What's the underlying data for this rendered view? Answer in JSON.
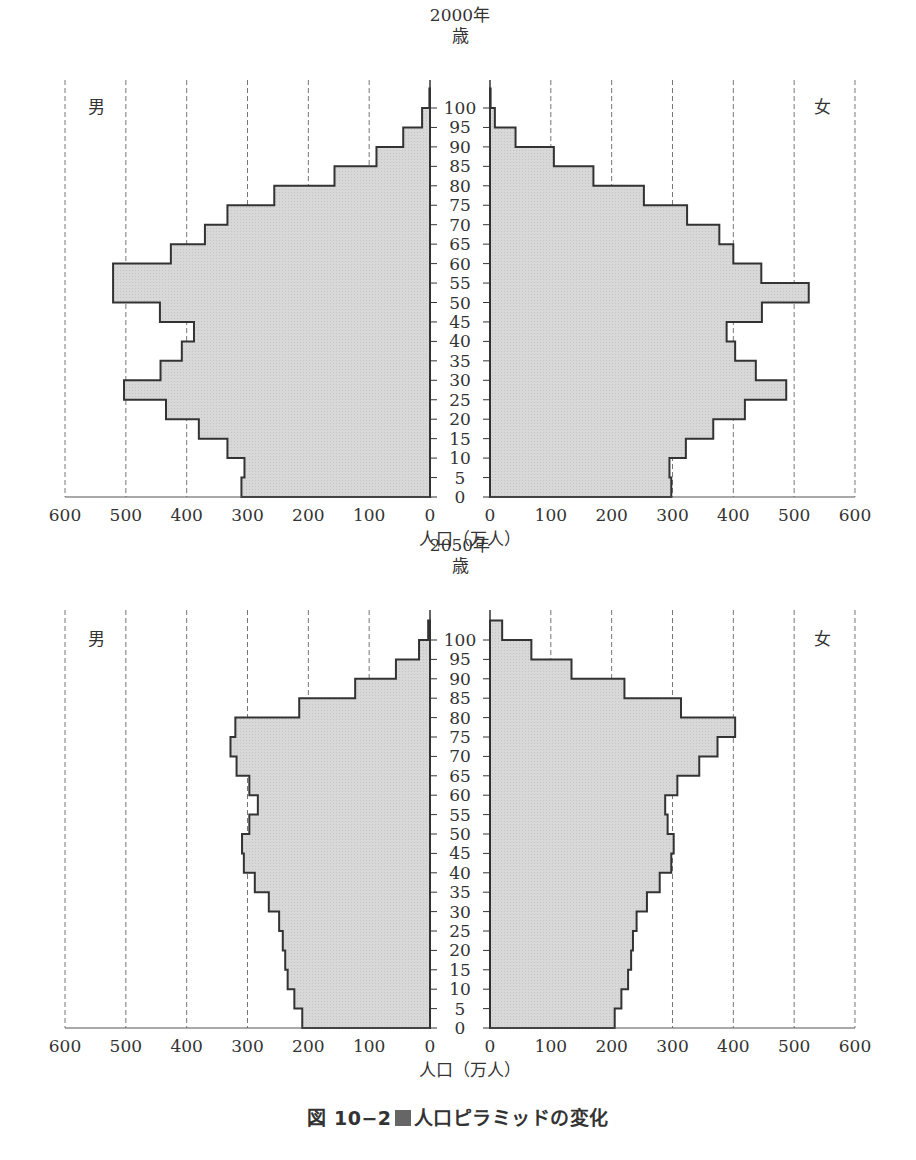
{
  "figure": {
    "caption_prefix": "図 10−2",
    "caption_text": "人口ピラミッドの変化",
    "age_unit_label": "歳",
    "male_label": "男",
    "female_label": "女",
    "xlabel": "人口（万人）",
    "fill_color": "#d8d8d8",
    "line_color": "#333333",
    "grid_color": "#777777"
  },
  "chart_data": [
    {
      "type": "bar",
      "subtype": "population-pyramid",
      "title": "2000年",
      "xlabel": "人口（万人）",
      "ylabel": "歳",
      "xlim": [
        0,
        600
      ],
      "x_ticks": [
        0,
        100,
        200,
        300,
        400,
        500,
        600
      ],
      "y_ticks": [
        0,
        5,
        10,
        15,
        20,
        25,
        30,
        35,
        40,
        45,
        50,
        55,
        60,
        65,
        70,
        75,
        80,
        85,
        90,
        95,
        100
      ],
      "grid": "vertical dashed",
      "categories": [
        "0-4",
        "5-9",
        "10-14",
        "15-19",
        "20-24",
        "25-29",
        "30-34",
        "35-39",
        "40-44",
        "45-49",
        "50-54",
        "55-59",
        "60-64",
        "65-69",
        "70-74",
        "75-79",
        "80-84",
        "85-89",
        "90-94",
        "95-99",
        "100+"
      ],
      "series": [
        {
          "name": "男",
          "values": [
            310,
            305,
            333,
            380,
            434,
            503,
            443,
            408,
            388,
            444,
            521,
            521,
            426,
            370,
            333,
            256,
            157,
            88,
            44,
            13,
            1
          ]
        },
        {
          "name": "女",
          "values": [
            298,
            295,
            322,
            367,
            419,
            487,
            437,
            403,
            389,
            447,
            524,
            446,
            400,
            377,
            324,
            253,
            170,
            105,
            42,
            8,
            1
          ]
        }
      ]
    },
    {
      "type": "bar",
      "subtype": "population-pyramid",
      "title": "2050年",
      "xlabel": "人口（万人）",
      "ylabel": "歳",
      "xlim": [
        0,
        600
      ],
      "x_ticks": [
        0,
        100,
        200,
        300,
        400,
        500,
        600
      ],
      "y_ticks": [
        0,
        5,
        10,
        15,
        20,
        25,
        30,
        35,
        40,
        45,
        50,
        55,
        60,
        65,
        70,
        75,
        80,
        85,
        90,
        95,
        100
      ],
      "grid": "vertical dashed",
      "categories": [
        "0-4",
        "5-9",
        "10-14",
        "15-19",
        "20-24",
        "25-29",
        "30-34",
        "35-39",
        "40-44",
        "45-49",
        "50-54",
        "55-59",
        "60-64",
        "65-69",
        "70-74",
        "75-79",
        "80-84",
        "85-89",
        "90-94",
        "95-99",
        "100+"
      ],
      "series": [
        {
          "name": "男",
          "values": [
            210,
            223,
            234,
            238,
            242,
            248,
            265,
            288,
            306,
            309,
            297,
            283,
            297,
            318,
            328,
            320,
            215,
            123,
            56,
            18,
            3
          ]
        },
        {
          "name": "女",
          "values": [
            205,
            216,
            227,
            232,
            235,
            241,
            258,
            279,
            298,
            302,
            292,
            288,
            308,
            344,
            374,
            403,
            314,
            221,
            134,
            68,
            20
          ]
        }
      ]
    }
  ]
}
